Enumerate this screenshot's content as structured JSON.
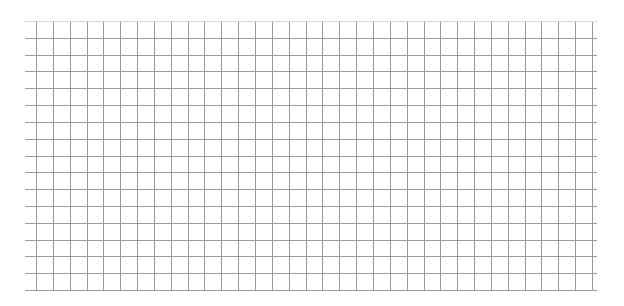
{
  "canvas": {
    "width": 624,
    "height": 306,
    "background": "#ffffff"
  },
  "grid": {
    "line_color": "#9a9a9a",
    "top_line_color": "#d8d8d8",
    "line_width": 1,
    "vertical": {
      "count": 34,
      "x_start": 36,
      "x_end": 592,
      "y_top": 21,
      "y_bottom": 290
    },
    "horizontal": {
      "count": 17,
      "y_start": 21,
      "y_end": 290,
      "x_left": 25,
      "x_right": 597
    }
  }
}
